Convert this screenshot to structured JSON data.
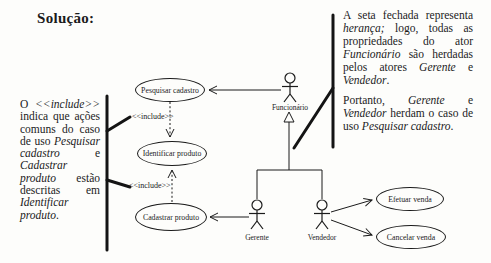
{
  "title": "Solução:",
  "left_note": {
    "segments": [
      {
        "t": "O ",
        "i": false
      },
      {
        "t": "<<include>>",
        "i": true
      },
      {
        "t": " indica que ações comuns do caso de uso ",
        "i": false
      },
      {
        "t": "Pesquisar cadastro",
        "i": true
      },
      {
        "t": " e ",
        "i": false
      },
      {
        "t": "Cadastrar produto",
        "i": true
      },
      {
        "t": " estão descritas em ",
        "i": false
      },
      {
        "t": "Identificar produto",
        "i": true
      },
      {
        "t": ".",
        "i": false
      }
    ]
  },
  "right_note": {
    "p1": {
      "segments": [
        {
          "t": "A seta fechada representa ",
          "i": false
        },
        {
          "t": "herança;",
          "i": true
        },
        {
          "t": " logo, todas as propriedades do ator ",
          "i": false
        },
        {
          "t": "Funcionário",
          "i": true
        },
        {
          "t": " são herdadas pelos atores ",
          "i": false
        },
        {
          "t": "Gerente",
          "i": true
        },
        {
          "t": " e ",
          "i": false
        },
        {
          "t": "Vendedor",
          "i": true
        },
        {
          "t": ".",
          "i": false
        }
      ]
    },
    "p2": {
      "segments": [
        {
          "t": "Portanto, ",
          "i": false
        },
        {
          "t": "Gerente",
          "i": true
        },
        {
          "t": " e ",
          "i": false
        },
        {
          "t": "Vendedor",
          "i": true
        },
        {
          "t": " herdam o caso de uso ",
          "i": false
        },
        {
          "t": "Pesquisar cadastro",
          "i": true
        },
        {
          "t": ".",
          "i": false
        }
      ]
    }
  },
  "diagram": {
    "use_cases": {
      "pesquisar": "Pesquisar cadastro",
      "identificar": "Identificar produto",
      "cadastrar": "Cadastrar produto",
      "efetuar": "Efetuar venda",
      "cancelar": "Cancelar venda"
    },
    "actors": {
      "funcionario": "Funcionário",
      "gerente": "Gerente",
      "vendedor": "Vendedor"
    },
    "stereotypes": {
      "include_top": "<<include>>",
      "include_bottom": "<<include>>"
    }
  },
  "colors": {
    "ink": "#1b1b1b",
    "background": "#fdfdfb"
  }
}
